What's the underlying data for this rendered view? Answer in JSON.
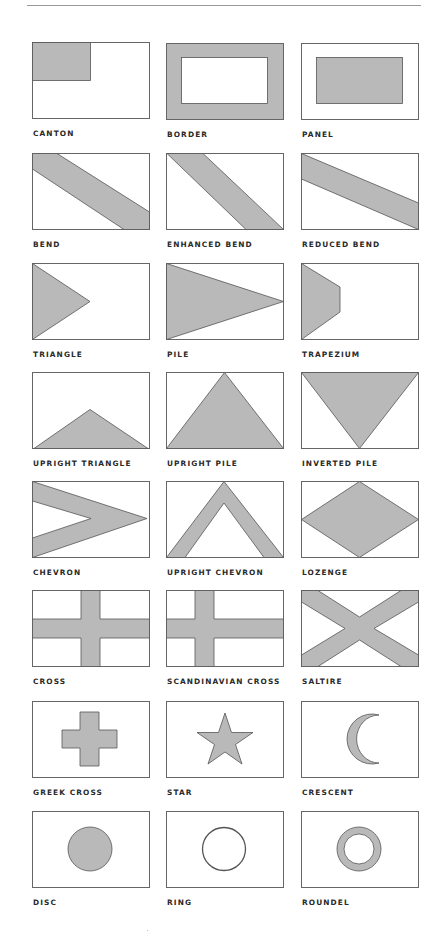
{
  "page": {
    "fill_color": "#b9b9b9",
    "stroke_color": "#555555",
    "background": "#ffffff"
  },
  "shapes": [
    {
      "label": "CANTON"
    },
    {
      "label": "BORDER"
    },
    {
      "label": "PANEL"
    },
    {
      "label": "BEND"
    },
    {
      "label": "ENHANCED BEND"
    },
    {
      "label": "REDUCED BEND"
    },
    {
      "label": "TRIANGLE"
    },
    {
      "label": "PILE"
    },
    {
      "label": "TRAPEZIUM"
    },
    {
      "label": "UPRIGHT TRIANGLE"
    },
    {
      "label": "UPRIGHT PILE"
    },
    {
      "label": "INVERTED PILE"
    },
    {
      "label": "CHEVRON"
    },
    {
      "label": "UPRIGHT CHEVRON"
    },
    {
      "label": "LOZENGE"
    },
    {
      "label": "CROSS"
    },
    {
      "label": "SCANDINAVIAN CROSS"
    },
    {
      "label": "SALTIRE"
    },
    {
      "label": "GREEK CROSS"
    },
    {
      "label": "STAR"
    },
    {
      "label": "CRESCENT"
    },
    {
      "label": "DISC"
    },
    {
      "label": "RING"
    },
    {
      "label": "ROUNDEL"
    }
  ]
}
